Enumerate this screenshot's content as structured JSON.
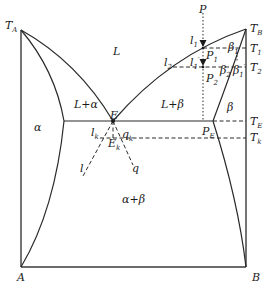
{
  "diagram": {
    "type": "binary eutectic phase diagram",
    "components": {
      "left": "A",
      "right": "B"
    },
    "melting_points": {
      "left": "T_A",
      "right": "T_B"
    },
    "temperature_labels": {
      "T1": "T",
      "T1_sub": "1",
      "T2": "T",
      "T2_sub": "2",
      "TE": "T",
      "TE_sub": "E",
      "Tk": "T",
      "Tk_sub": "k",
      "TA": "T",
      "TA_sub": "A",
      "TB": "T",
      "TB_sub": "B"
    },
    "regions": {
      "liquid": "L",
      "liquid_alpha": "L+α",
      "liquid_beta": "L+β",
      "alpha": "α",
      "beta": "β",
      "alpha_beta": "α+β"
    },
    "points": {
      "P": "P",
      "P1": "P",
      "P1_sub": "1",
      "P2": "P",
      "P2_sub": "2",
      "PE": "P",
      "PE_sub": "E",
      "E": "E",
      "Ek": "E",
      "Ek_sub": "k",
      "l1": "l",
      "l1_sub": "1",
      "l1p": "l",
      "l1p_sub": "1",
      "l1p_prime": "′",
      "l2": "l",
      "l2_sub": "2",
      "lk": "l",
      "lk_sub": "k",
      "qk": "q",
      "qk_sub": "k",
      "l": "l",
      "q": "q",
      "beta1": "β",
      "beta1_sub": "1",
      "beta2": "β",
      "beta2_sub": "2",
      "beta1p": "β",
      "beta1p_sub": "1",
      "beta1p_prime": "′"
    },
    "axis_labels": {
      "A": "A",
      "B": "B"
    }
  }
}
